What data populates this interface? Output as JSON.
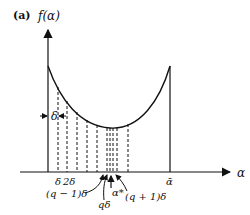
{
  "figure": {
    "panel_label": "(a)",
    "y_axis_label": "f(α)",
    "x_axis_label": "α",
    "delta_label": "δ",
    "x_tick_labels": {
      "delta": "δ",
      "two_delta": "2δ",
      "alpha_bar": "ᾱ"
    },
    "annotations": {
      "q_minus_1_delta": "(q − 1)δ",
      "q_delta": "qδ",
      "alpha_star": "α*",
      "q_plus_1_delta": "(q + 1)δ"
    }
  },
  "colors": {
    "ink": "#111111",
    "background": "#ffffff"
  }
}
